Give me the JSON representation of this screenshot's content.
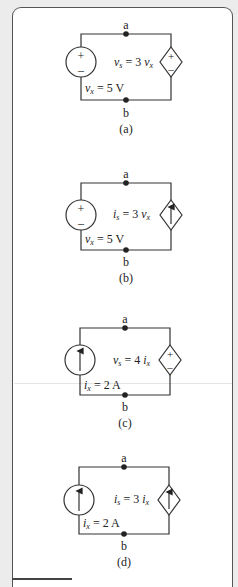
{
  "figure": {
    "panels": [
      {
        "id": "a",
        "caption": "(a)",
        "top_node": "a",
        "bottom_node": "b",
        "independent_source": {
          "type": "voltage",
          "label_var": "v",
          "label_sub": "x",
          "label_rest": " = 5 V",
          "plus": "+",
          "minus": "–"
        },
        "dependent_source": {
          "type": "voltage",
          "label_var": "v",
          "label_sub": "s",
          "label_mid": " = 3 ",
          "ctrl_var": "v",
          "ctrl_sub": "x",
          "plus": "+",
          "minus": "–"
        }
      },
      {
        "id": "b",
        "caption": "(b)",
        "top_node": "a",
        "bottom_node": "b",
        "independent_source": {
          "type": "voltage",
          "label_var": "v",
          "label_sub": "x",
          "label_rest": " = 5 V",
          "plus": "+",
          "minus": "–"
        },
        "dependent_source": {
          "type": "current",
          "label_var": "i",
          "label_sub": "s",
          "label_mid": " = 3 ",
          "ctrl_var": "v",
          "ctrl_sub": "x"
        }
      },
      {
        "id": "c",
        "caption": "(c)",
        "top_node": "a",
        "bottom_node": "b",
        "independent_source": {
          "type": "current",
          "label_var": "i",
          "label_sub": "x",
          "label_rest": " = 2 A"
        },
        "dependent_source": {
          "type": "voltage",
          "label_var": "v",
          "label_sub": "s",
          "label_mid": " = 4 ",
          "ctrl_var": "i",
          "ctrl_sub": "x",
          "plus": "+",
          "minus": "–"
        }
      },
      {
        "id": "d",
        "caption": "(d)",
        "top_node": "a",
        "bottom_node": "b",
        "independent_source": {
          "type": "current",
          "label_var": "i",
          "label_sub": "x",
          "label_rest": " = 2 A"
        },
        "dependent_source": {
          "type": "current",
          "label_var": "i",
          "label_sub": "s",
          "label_mid": " = 3 ",
          "ctrl_var": "i",
          "ctrl_sub": "x"
        }
      }
    ]
  }
}
